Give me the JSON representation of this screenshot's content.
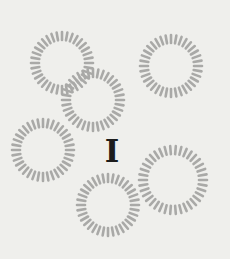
{
  "numeral": {
    "text": "I"
  },
  "colors": {
    "background": "#efefec",
    "ring": "#a9a9a7",
    "numeral": "#1c1c1c"
  },
  "rings": [
    {
      "cx": 62,
      "cy": 63,
      "r": 27,
      "ticks": 36
    },
    {
      "cx": 93,
      "cy": 100,
      "r": 27,
      "ticks": 36
    },
    {
      "cx": 171,
      "cy": 66,
      "r": 27,
      "ticks": 36
    },
    {
      "cx": 43,
      "cy": 150,
      "r": 27,
      "ticks": 36
    },
    {
      "cx": 108,
      "cy": 205,
      "r": 27,
      "ticks": 36
    },
    {
      "cx": 173,
      "cy": 180,
      "r": 30,
      "ticks": 38
    }
  ]
}
